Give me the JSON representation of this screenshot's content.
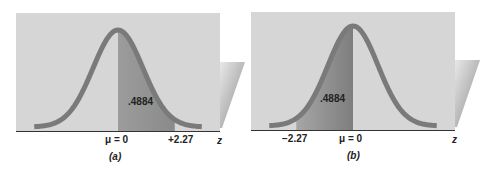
{
  "panels": [
    {
      "id": "a",
      "caption": "(a)",
      "area_label": ".4884",
      "mean_label": "μ = 0",
      "z_value_label": "+2.27",
      "z_value": 2.27,
      "shaded_from": 0,
      "shaded_to": 2.27,
      "axis_label": "z"
    },
    {
      "id": "b",
      "caption": "(b)",
      "area_label": ".4884",
      "mean_label": "μ = 0",
      "z_value_label": "−2.27",
      "z_value": -2.27,
      "shaded_from": -2.27,
      "shaded_to": 0,
      "axis_label": "z"
    }
  ],
  "colors": {
    "background_panel": "#d6d6d6",
    "shaded_area": "#9a9a9a",
    "curve": "#7a7a7a",
    "axis": "#333333"
  }
}
